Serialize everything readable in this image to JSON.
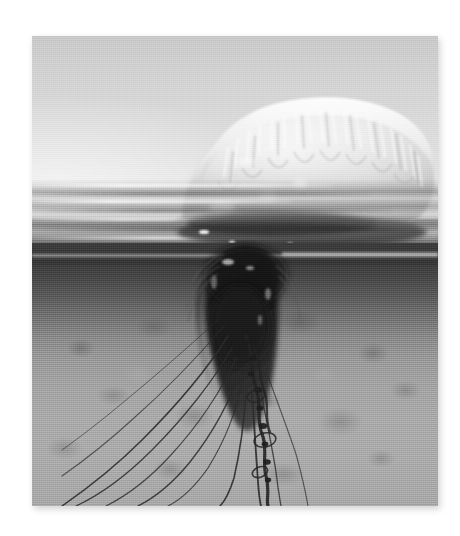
{
  "page": {
    "background_color": "#ffffff",
    "width": 460,
    "height": 536
  },
  "photo": {
    "subject": "portuguese-man-o-war",
    "alt_text": "Portuguese man o' war jellyfish floating at the ocean surface, over-under split view showing the gas-filled float above water and long trailing tentacles below",
    "style": "black-and-white photograph",
    "frame": {
      "left": 32,
      "top": 36,
      "width": 406,
      "height": 470,
      "shadow": "soft drop shadow, lower-right"
    },
    "regions": [
      {
        "name": "sky",
        "label": "Sky above the waterline",
        "tone": "light gray gradient, brighter toward the horizon",
        "color_top": "#c9c9c9",
        "color_bottom": "#ececec"
      },
      {
        "name": "waterline",
        "label": "Water surface with horizontal reflection streaks",
        "tone": "alternating light and dark horizontal bands",
        "color": "#9e9e9e"
      },
      {
        "name": "underwater",
        "label": "Dark water column beneath the surface",
        "tone": "dark gray fading to lighter gray with depth",
        "color_top": "#3c3c3c",
        "color_bottom": "#ababab"
      },
      {
        "name": "seafloor",
        "label": "Mottled sandy sea floor",
        "tone": "blotchy mid-gray texture",
        "color": "#a8a8a8"
      }
    ],
    "subject_parts": [
      {
        "name": "float",
        "label": "Gas-filled float (pneumatophore) above the water",
        "tone": "brightest element in the frame, near white",
        "color": "#f2f2f2"
      },
      {
        "name": "crest",
        "label": "Ridged crest along the top of the float",
        "tone": "finely striated highlight",
        "color": "#fbfbfb"
      },
      {
        "name": "tentacle-mass",
        "label": "Dense dark cluster of tentacles just below the surface",
        "tone": "near black",
        "color": "#1a1a1a"
      },
      {
        "name": "tentacles",
        "label": "Long thin tentacles trailing down and to the lower left",
        "tone": "thin dark filaments",
        "color": "#2b2b2b"
      }
    ]
  }
}
